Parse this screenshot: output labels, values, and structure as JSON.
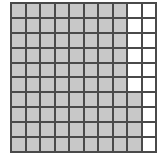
{
  "grid": {
    "rows": 10,
    "cols": 10,
    "shaded_color": "#c8c8c8",
    "empty_color": "#ffffff",
    "line_color": "#4a4a4a",
    "shaded_count": 84,
    "total_cells": 100,
    "shaded_rule": "Columns 1-8 fully shaded; column 9 shaded in rows 7-10; column 10 unshaded",
    "shaded": [
      [
        1,
        1,
        1,
        1,
        1,
        1,
        1,
        1,
        0,
        0
      ],
      [
        1,
        1,
        1,
        1,
        1,
        1,
        1,
        1,
        0,
        0
      ],
      [
        1,
        1,
        1,
        1,
        1,
        1,
        1,
        1,
        0,
        0
      ],
      [
        1,
        1,
        1,
        1,
        1,
        1,
        1,
        1,
        0,
        0
      ],
      [
        1,
        1,
        1,
        1,
        1,
        1,
        1,
        1,
        0,
        0
      ],
      [
        1,
        1,
        1,
        1,
        1,
        1,
        1,
        1,
        0,
        0
      ],
      [
        1,
        1,
        1,
        1,
        1,
        1,
        1,
        1,
        1,
        0
      ],
      [
        1,
        1,
        1,
        1,
        1,
        1,
        1,
        1,
        1,
        0
      ],
      [
        1,
        1,
        1,
        1,
        1,
        1,
        1,
        1,
        1,
        0
      ],
      [
        1,
        1,
        1,
        1,
        1,
        1,
        1,
        1,
        1,
        0
      ]
    ]
  }
}
